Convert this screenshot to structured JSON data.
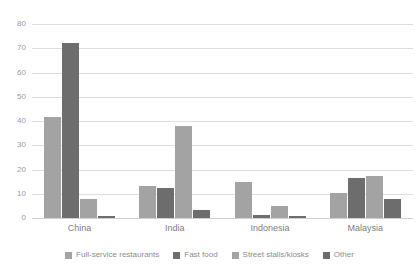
{
  "chart_data": {
    "type": "bar",
    "title": "",
    "subtitle": "",
    "xlabel": "",
    "ylabel": "",
    "ylim": [
      0,
      80
    ],
    "yticks": [
      0,
      10,
      20,
      30,
      40,
      50,
      60,
      70,
      80
    ],
    "ytick_labels": [
      "0",
      "10",
      "20",
      "30",
      "40",
      "50",
      "60",
      "70",
      "80"
    ],
    "grid": "horizontal",
    "legend_position": "bottom",
    "orientation": "vertical",
    "grouping": "grouped",
    "categories": [
      "China",
      "India",
      "Indonesia",
      "Malaysia"
    ],
    "series": [
      {
        "name": "Full-service restaurants",
        "color": "#a3a3a3",
        "values": [
          41.5,
          13.0,
          15.0,
          10.5
        ]
      },
      {
        "name": "Fast food",
        "color": "#6d6d6d",
        "values": [
          72.0,
          12.5,
          1.3,
          16.3
        ]
      },
      {
        "name": "Street stalls/kiosks",
        "color": "#a3a3a3",
        "values": [
          8.0,
          38.0,
          5.0,
          17.2
        ]
      },
      {
        "name": "Other",
        "color": "#6d6d6d",
        "values": [
          1.0,
          3.5,
          1.0,
          8.0
        ]
      }
    ],
    "annotations": []
  },
  "style": {
    "background": "#ffffff",
    "gridline_color": "#dededd",
    "baseline_color": "#cfcfce",
    "tick_label_color": "#9b9b9b",
    "category_label_color": "#7d7d7d",
    "legend_label_color": "#8d8d8d"
  }
}
